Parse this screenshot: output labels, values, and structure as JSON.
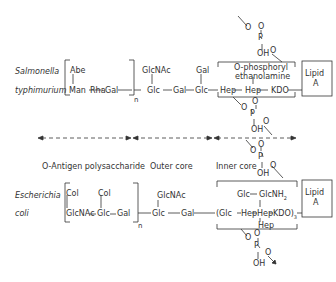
{
  "salmonella": {
    "organism_line1": "Salmonella",
    "organism_line2": "typhimurium",
    "o_antigen": {
      "branch": "Abe",
      "chain": [
        "Man",
        "Rha",
        "Gal"
      ],
      "repeat": "n"
    },
    "outer_core": {
      "branch_glcnac": "GlcNAc",
      "branch_gal": "Gal",
      "chain": [
        "Glc",
        "Gal",
        "Glc"
      ]
    },
    "inner_core": {
      "chain": [
        "Hep",
        "Hep",
        "KDO"
      ],
      "annotation_line1": "O-phosphoryl",
      "annotation_line2": "ethanolamine"
    },
    "lipid": {
      "line1": "Lipid",
      "line2": "A"
    },
    "phosphate": {
      "o": "O",
      "p": "P",
      "oh": "OH"
    }
  },
  "regions": {
    "o_antigen_label": "O-Antigen  polysaccharide",
    "outer_core_label": "Outer core",
    "inner_core_label": "Inner core"
  },
  "ecoli": {
    "organism_line1": "Escherichia",
    "organism_line2": "coli",
    "o_antigen": {
      "branch1": "Col",
      "branch2": "Col",
      "chain": [
        "GlcNAc",
        "Glc",
        "Gal"
      ],
      "repeat": "n"
    },
    "outer_core": {
      "branch": "GlcNAc",
      "chain": [
        "Glc",
        "Gal"
      ]
    },
    "inner_core": {
      "branch_top_left": "Glc",
      "branch_top_right": "GlcNH",
      "branch_top_sub": "2",
      "chain_prefix": "(Glc",
      "chain": [
        "Hep",
        "Hep",
        "KDO)"
      ],
      "chain_sub": "3",
      "branch_bottom": "Hep"
    },
    "lipid": {
      "line1": "Lipid",
      "line2": "A"
    },
    "phosphate": {
      "o": "O",
      "p": "P",
      "oh": "OH"
    }
  }
}
